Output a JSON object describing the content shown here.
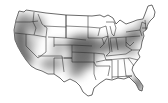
{
  "map": {
    "title": "",
    "region": "Contiguous United States",
    "style": "grayscale density shading",
    "colors": {
      "background": "#ffffff",
      "land": "#ffffff",
      "border": "#2a2a2a",
      "high_density": "#555555",
      "medium_density": "#8a8a8a",
      "low_density": "#c8c8c8"
    },
    "shaded_regions": [
      {
        "name": "Pacific Coast (California / Oregon / Washington)",
        "intensity": "high"
      },
      {
        "name": "Idaho / Snake River",
        "intensity": "medium"
      },
      {
        "name": "Southern Arizona / New Mexico",
        "intensity": "medium"
      },
      {
        "name": "Central Plains (Kansas / Nebraska / Missouri / Oklahoma)",
        "intensity": "high"
      },
      {
        "name": "Ohio Valley / Mid-Atlantic",
        "intensity": "high"
      },
      {
        "name": "Northeast (Pennsylvania / New York / New England south)",
        "intensity": "medium"
      },
      {
        "name": "Florida Peninsula",
        "intensity": "high"
      },
      {
        "name": "North Texas",
        "intensity": "medium"
      }
    ],
    "unshaded_regions": [
      "Great Lakes north",
      "Northern Plains",
      "Deep South",
      "Great Basin center"
    ]
  }
}
